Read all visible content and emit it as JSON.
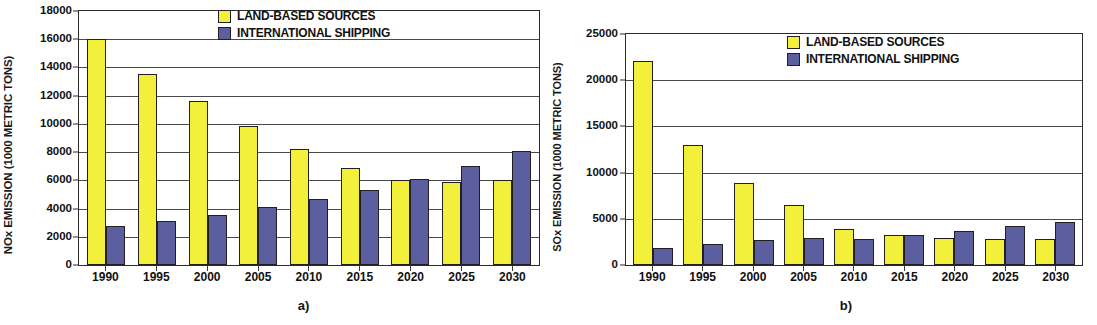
{
  "figure": {
    "panels": [
      {
        "id": "panel-a",
        "subcaption": "a)",
        "ylabel": "NOx EMISSION (1000 METRIC TONS)",
        "legend": [
          {
            "key": "land",
            "label": "LAND-BASED SOURCES",
            "color": "#f3f03c"
          },
          {
            "key": "ship",
            "label": "INTERNATIONAL SHIPPING",
            "color": "#5b5fa0"
          }
        ]
      },
      {
        "id": "panel-b",
        "subcaption": "b)",
        "ylabel": "SOx EMISSION (1000 METRIC TONS)",
        "legend": [
          {
            "key": "land",
            "label": "LAND-BASED SOURCES",
            "color": "#f3f03c"
          },
          {
            "key": "ship",
            "label": "INTERNATIONAL SHIPPING",
            "color": "#5b5fa0"
          }
        ]
      }
    ]
  },
  "chart_data": [
    {
      "type": "bar",
      "panel": "a)",
      "title": "",
      "xlabel": "",
      "ylabel": "NOx EMISSION (1000 METRIC TONS)",
      "categories": [
        "1990",
        "1995",
        "2000",
        "2005",
        "2010",
        "2015",
        "2020",
        "2025",
        "2030"
      ],
      "series": [
        {
          "name": "LAND-BASED SOURCES",
          "color": "#f3f03c",
          "values": [
            16000,
            13550,
            11650,
            9850,
            8200,
            6850,
            6000,
            5850,
            6050
          ]
        },
        {
          "name": "INTERNATIONAL SHIPPING",
          "color": "#5b5fa0",
          "values": [
            2750,
            3150,
            3550,
            4100,
            4700,
            5350,
            6100,
            7000,
            8100
          ]
        }
      ],
      "ylim": [
        0,
        18000
      ],
      "yticks": [
        0,
        2000,
        4000,
        6000,
        8000,
        10000,
        12000,
        14000,
        16000,
        18000
      ],
      "ytick_labels": [
        "0",
        "2000",
        "4000",
        "6000",
        "8000",
        "10000",
        "12000",
        "14000",
        "16000",
        "18000"
      ],
      "grid": true,
      "legend_position": "top-right"
    },
    {
      "type": "bar",
      "panel": "b)",
      "title": "",
      "xlabel": "",
      "ylabel": "SOx EMISSION (1000 METRIC TONS)",
      "categories": [
        "1990",
        "1995",
        "2000",
        "2005",
        "2010",
        "2015",
        "2020",
        "2025",
        "2030"
      ],
      "series": [
        {
          "name": "LAND-BASED SOURCES",
          "color": "#f3f03c",
          "values": [
            22100,
            12950,
            8850,
            6500,
            3950,
            3300,
            2950,
            2800,
            2850
          ]
        },
        {
          "name": "INTERNATIONAL SHIPPING",
          "color": "#5b5fa0",
          "values": [
            1850,
            2250,
            2700,
            2900,
            2800,
            3250,
            3700,
            4200,
            4700
          ]
        }
      ],
      "ylim": [
        0,
        25000
      ],
      "yticks": [
        0,
        5000,
        10000,
        15000,
        20000,
        25000
      ],
      "ytick_labels": [
        "0",
        "5000",
        "10000",
        "15000",
        "20000",
        "25000"
      ],
      "grid": true,
      "legend_position": "top-right"
    }
  ]
}
